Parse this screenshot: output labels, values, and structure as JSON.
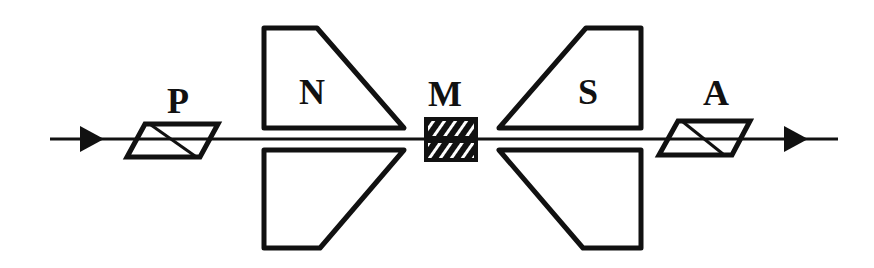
{
  "diagram": {
    "labels": {
      "polarizer": "P",
      "north_pole": "N",
      "medium": "M",
      "south_pole": "S",
      "analyzer": "A"
    },
    "colors": {
      "stroke": "#111111",
      "background": "#ffffff"
    },
    "beam": {
      "direction": "left-to-right",
      "arrows": 2
    }
  }
}
